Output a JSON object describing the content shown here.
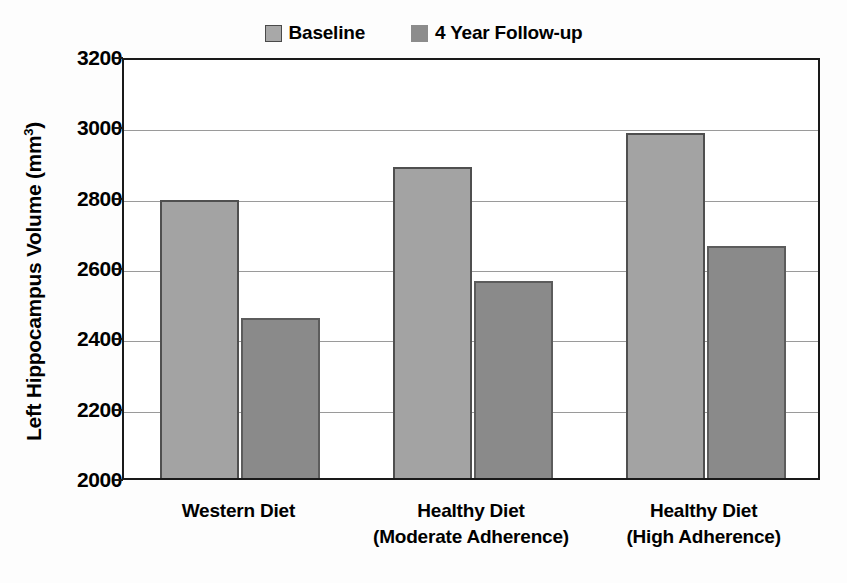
{
  "chart_data": {
    "type": "bar",
    "title": "",
    "xlabel": "",
    "ylabel": "Left Hippocampus Volume (mm3)",
    "ylabel_base": "Left Hippocampus Volume (mm",
    "ylabel_sup": "3",
    "ylabel_close": ")",
    "ylim": [
      2000,
      3200
    ],
    "ytick_labels": [
      "3200",
      "3000",
      "2800",
      "2600",
      "2400",
      "2200",
      "2000"
    ],
    "ytick_values": [
      3200,
      3000,
      2800,
      2600,
      2400,
      2200,
      2000
    ],
    "grid": true,
    "legend_position": "top-center",
    "categories": [
      "Western Diet",
      "Healthy Diet (Moderate Adherence)",
      "Healthy Diet (High Adherence)"
    ],
    "category_lines": [
      [
        "Western Diet"
      ],
      [
        "Healthy Diet",
        "(Moderate Adherence)"
      ],
      [
        "Healthy Diet",
        "(High Adherence)"
      ]
    ],
    "series": [
      {
        "name": "Baseline",
        "color": "#a3a3a3",
        "values": [
          2790,
          2885,
          2980
        ]
      },
      {
        "name": "4 Year Follow-up",
        "color": "#8a8a8a",
        "values": [
          2455,
          2560,
          2660
        ]
      }
    ]
  },
  "legend": {
    "entries": [
      {
        "label": "Baseline",
        "swatch": "legend-swatch-baseline"
      },
      {
        "label": "4 Year Follow-up",
        "swatch": "legend-swatch-followup"
      }
    ]
  },
  "colors": {
    "baseline_fill": "#a3a3a3",
    "baseline_border": "#4f4f4f",
    "followup_fill": "#8a8a8a",
    "followup_border": "#5c5c5c",
    "axis": "#1a1a1a",
    "gridline": "#9a9a9a",
    "background": "#fdfdfd"
  }
}
